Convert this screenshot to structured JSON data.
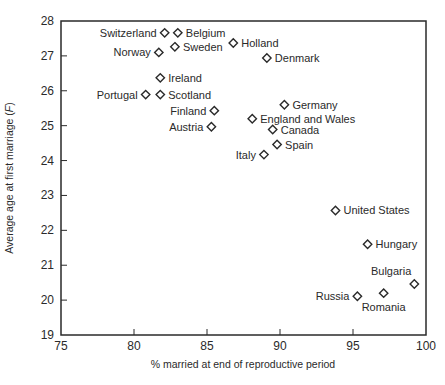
{
  "chart_data": {
    "type": "scatter",
    "title": "",
    "xlabel": "% married at end of reproductive period",
    "ylabel": "Average age at first marriage (F)",
    "xlim": [
      75,
      100
    ],
    "ylim": [
      19,
      28
    ],
    "xticks": [
      75,
      80,
      85,
      90,
      95,
      100
    ],
    "yticks": [
      19,
      20,
      21,
      22,
      23,
      24,
      25,
      26,
      27,
      28
    ],
    "grid": false,
    "marker": "diamond-open",
    "points": [
      {
        "label": "Switzerland",
        "x": 82.1,
        "y": 27.66,
        "pos": "left"
      },
      {
        "label": "Belgium",
        "x": 83.0,
        "y": 27.66,
        "pos": "right"
      },
      {
        "label": "Norway",
        "x": 81.7,
        "y": 27.1,
        "pos": "left"
      },
      {
        "label": "Sweden",
        "x": 82.8,
        "y": 27.26,
        "pos": "right"
      },
      {
        "label": "Holland",
        "x": 86.8,
        "y": 27.37,
        "pos": "right"
      },
      {
        "label": "Denmark",
        "x": 89.1,
        "y": 26.94,
        "pos": "right"
      },
      {
        "label": "Ireland",
        "x": 81.8,
        "y": 26.37,
        "pos": "right"
      },
      {
        "label": "Portugal",
        "x": 80.8,
        "y": 25.89,
        "pos": "left"
      },
      {
        "label": "Scotland",
        "x": 81.8,
        "y": 25.89,
        "pos": "right"
      },
      {
        "label": "Germany",
        "x": 90.3,
        "y": 25.6,
        "pos": "right"
      },
      {
        "label": "Finland",
        "x": 85.5,
        "y": 25.43,
        "pos": "left"
      },
      {
        "label": "England and Wales",
        "x": 88.1,
        "y": 25.2,
        "pos": "right"
      },
      {
        "label": "Austria",
        "x": 85.3,
        "y": 24.97,
        "pos": "left"
      },
      {
        "label": "Canada",
        "x": 89.5,
        "y": 24.89,
        "pos": "right"
      },
      {
        "label": "Spain",
        "x": 89.8,
        "y": 24.46,
        "pos": "right"
      },
      {
        "label": "Italy",
        "x": 88.9,
        "y": 24.17,
        "pos": "left"
      },
      {
        "label": "United States",
        "x": 93.8,
        "y": 22.57,
        "pos": "right"
      },
      {
        "label": "Hungary",
        "x": 96.0,
        "y": 21.6,
        "pos": "right"
      },
      {
        "label": "Bulgaria",
        "x": 99.2,
        "y": 20.46,
        "pos": "above-left"
      },
      {
        "label": "Romania",
        "x": 97.1,
        "y": 20.2,
        "pos": "below"
      },
      {
        "label": "Russia",
        "x": 95.3,
        "y": 20.11,
        "pos": "left"
      }
    ]
  },
  "colors": {
    "axis": "#2a2a2a",
    "marker": "#2a2a2a",
    "text": "#2a2a2a",
    "background": "#ffffff"
  }
}
